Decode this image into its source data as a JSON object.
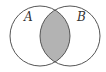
{
  "diagram": {
    "type": "venn",
    "sets": [
      {
        "label": "A",
        "cx": 40,
        "cy": 36,
        "r": 30
      },
      {
        "label": "B",
        "cx": 70,
        "cy": 36,
        "r": 30
      }
    ],
    "shaded_region": "A ∩ B",
    "colors": {
      "outline": "#555555",
      "shade": "#b3b3b3",
      "background": "#ffffff"
    }
  }
}
